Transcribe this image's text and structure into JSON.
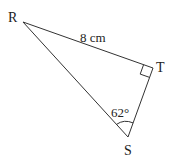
{
  "diagram": {
    "type": "right-triangle",
    "vertices": {
      "R": {
        "label": "R",
        "x": 23,
        "y": 22
      },
      "T": {
        "label": "T",
        "x": 153,
        "y": 68
      },
      "S": {
        "label": "S",
        "x": 128,
        "y": 137
      }
    },
    "side_RT": {
      "label": "8 cm"
    },
    "angle_S": {
      "label": "62°"
    },
    "right_angle_at": "T",
    "stroke_color": "#333333"
  }
}
